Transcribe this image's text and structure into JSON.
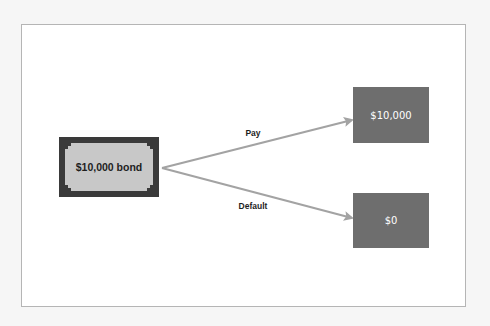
{
  "diagram": {
    "type": "decision-tree",
    "colors": {
      "page_background": "#f6f6f6",
      "frame_background": "#ffffff",
      "frame_border": "#b5b5b5",
      "bond_border": "#3a3a3a",
      "bond_fill": "#c8c8c8",
      "outcome_fill": "#6e6e6e",
      "arrow": "#a3a3a3",
      "label_text": "#1e1e1e",
      "outcome_text": "#ffffff"
    },
    "source": {
      "label": "$10,000 bond"
    },
    "branches": [
      {
        "label": "Pay",
        "outcome": "$10,000"
      },
      {
        "label": "Default",
        "outcome": "$0"
      }
    ]
  }
}
